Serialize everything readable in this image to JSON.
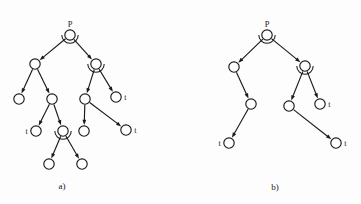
{
  "figure": {
    "background_color": "#fdfdfd",
    "stroke_color": "#1a1a1a",
    "node_fill": "#ffffff"
  },
  "captions": [
    {
      "id": "caption-a",
      "text": "a)",
      "x": 62,
      "y": 189
    },
    {
      "id": "caption-b",
      "text": "b)",
      "x": 275,
      "y": 190
    }
  ],
  "diagrams": [
    {
      "id": "diagram-a",
      "caption": "a)",
      "root_label": "P",
      "nodes": [
        {
          "id": "a-root",
          "x": 70,
          "y": 35,
          "r": 5.2,
          "label": "P",
          "label_pos": "top",
          "and_arc": true
        },
        {
          "id": "a-n1",
          "x": 35,
          "y": 64,
          "r": 5.2,
          "label": "",
          "label_pos": "",
          "and_arc": false
        },
        {
          "id": "a-n2",
          "x": 96,
          "y": 64,
          "r": 5.2,
          "label": "",
          "label_pos": "",
          "and_arc": true
        },
        {
          "id": "a-n3",
          "x": 19,
          "y": 99,
          "r": 5.2,
          "label": "",
          "label_pos": "",
          "and_arc": false
        },
        {
          "id": "a-n4",
          "x": 52,
          "y": 99,
          "r": 5.2,
          "label": "",
          "label_pos": "",
          "and_arc": false
        },
        {
          "id": "a-n5",
          "x": 85,
          "y": 99,
          "r": 5.2,
          "label": "",
          "label_pos": "",
          "and_arc": false
        },
        {
          "id": "a-n6",
          "x": 116,
          "y": 97,
          "r": 5.2,
          "label": "t",
          "label_pos": "right",
          "and_arc": false
        },
        {
          "id": "a-n7",
          "x": 36,
          "y": 131,
          "r": 5.2,
          "label": "t",
          "label_pos": "left",
          "and_arc": false
        },
        {
          "id": "a-n8",
          "x": 63,
          "y": 131,
          "r": 5.2,
          "label": "",
          "label_pos": "",
          "and_arc": true
        },
        {
          "id": "a-n9",
          "x": 84,
          "y": 131,
          "r": 5.2,
          "label": "",
          "label_pos": "",
          "and_arc": false
        },
        {
          "id": "a-n10",
          "x": 126,
          "y": 130,
          "r": 5.2,
          "label": "t",
          "label_pos": "right",
          "and_arc": false
        },
        {
          "id": "a-n11",
          "x": 49,
          "y": 164,
          "r": 5.2,
          "label": "",
          "label_pos": "",
          "and_arc": false
        },
        {
          "id": "a-n12",
          "x": 82,
          "y": 164,
          "r": 5.2,
          "label": "",
          "label_pos": "",
          "and_arc": false
        }
      ],
      "edges": [
        {
          "from": "a-root",
          "to": "a-n1"
        },
        {
          "from": "a-root",
          "to": "a-n2"
        },
        {
          "from": "a-n1",
          "to": "a-n3"
        },
        {
          "from": "a-n1",
          "to": "a-n4"
        },
        {
          "from": "a-n2",
          "to": "a-n5"
        },
        {
          "from": "a-n2",
          "to": "a-n6"
        },
        {
          "from": "a-n4",
          "to": "a-n7"
        },
        {
          "from": "a-n4",
          "to": "a-n8"
        },
        {
          "from": "a-n5",
          "to": "a-n9"
        },
        {
          "from": "a-n5",
          "to": "a-n10"
        },
        {
          "from": "a-n8",
          "to": "a-n11"
        },
        {
          "from": "a-n8",
          "to": "a-n12"
        }
      ]
    },
    {
      "id": "diagram-b",
      "caption": "b)",
      "root_label": "P",
      "nodes": [
        {
          "id": "b-root",
          "x": 267,
          "y": 35,
          "r": 5.2,
          "label": "P",
          "label_pos": "top",
          "and_arc": true
        },
        {
          "id": "b-n1",
          "x": 234,
          "y": 67,
          "r": 5.2,
          "label": "",
          "label_pos": "",
          "and_arc": false
        },
        {
          "id": "b-n2",
          "x": 305,
          "y": 66,
          "r": 5.2,
          "label": "",
          "label_pos": "",
          "and_arc": true
        },
        {
          "id": "b-n3",
          "x": 251,
          "y": 104,
          "r": 5.2,
          "label": "",
          "label_pos": "",
          "and_arc": false
        },
        {
          "id": "b-n4",
          "x": 289,
          "y": 106,
          "r": 5.2,
          "label": "",
          "label_pos": "",
          "and_arc": false
        },
        {
          "id": "b-n5",
          "x": 320,
          "y": 104,
          "r": 5.2,
          "label": "t",
          "label_pos": "right",
          "and_arc": false
        },
        {
          "id": "b-n6",
          "x": 229,
          "y": 143,
          "r": 5.2,
          "label": "t",
          "label_pos": "left",
          "and_arc": false
        },
        {
          "id": "b-n7",
          "x": 336,
          "y": 143,
          "r": 5.2,
          "label": "t",
          "label_pos": "right",
          "and_arc": false
        }
      ],
      "edges": [
        {
          "from": "b-root",
          "to": "b-n1"
        },
        {
          "from": "b-root",
          "to": "b-n2"
        },
        {
          "from": "b-n1",
          "to": "b-n3"
        },
        {
          "from": "b-n2",
          "to": "b-n4"
        },
        {
          "from": "b-n2",
          "to": "b-n5"
        },
        {
          "from": "b-n3",
          "to": "b-n6"
        },
        {
          "from": "b-n4",
          "to": "b-n7"
        }
      ]
    }
  ]
}
